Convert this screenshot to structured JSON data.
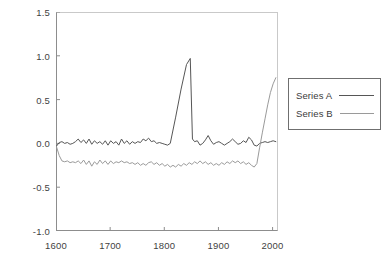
{
  "chart_data": {
    "type": "line",
    "title": "",
    "xlabel": "",
    "ylabel": "",
    "xlim": [
      1600,
      2010
    ],
    "ylim": [
      -1.0,
      1.5
    ],
    "grid": false,
    "legend_position": "right",
    "xticks": [
      1600,
      1700,
      1800,
      1900,
      2000
    ],
    "xtick_labels": [
      "1600",
      "1700",
      "1800",
      "1900",
      "2000"
    ],
    "yticks": [
      -1.0,
      -0.5,
      0.0,
      0.5,
      1.0,
      1.5
    ],
    "ytick_labels": [
      "-1.0",
      "-0.5",
      "0.0",
      "0.5",
      "1.0",
      "1.5"
    ],
    "series": [
      {
        "name": "Series A",
        "color": "#565656",
        "x": [
          1601,
          1606,
          1611,
          1616,
          1621,
          1626,
          1631,
          1636,
          1641,
          1646,
          1651,
          1656,
          1661,
          1666,
          1671,
          1676,
          1681,
          1686,
          1691,
          1696,
          1701,
          1706,
          1711,
          1716,
          1721,
          1726,
          1731,
          1736,
          1741,
          1746,
          1751,
          1756,
          1761,
          1766,
          1771,
          1776,
          1781,
          1786,
          1791,
          1796,
          1801,
          1806,
          1811,
          1821,
          1831,
          1841,
          1848,
          1852,
          1856,
          1861,
          1866,
          1871,
          1876,
          1881,
          1886,
          1891,
          1896,
          1901,
          1906,
          1911,
          1916,
          1921,
          1926,
          1931,
          1936,
          1941,
          1946,
          1951,
          1956,
          1961,
          1966,
          1971,
          1976,
          1981,
          1986,
          1991,
          1996,
          2001,
          2006
        ],
        "y": [
          -0.03,
          0.01,
          0.02,
          0.0,
          0.01,
          -0.01,
          0.0,
          0.02,
          0.05,
          0.01,
          0.04,
          0.0,
          0.05,
          -0.01,
          0.03,
          0.0,
          0.02,
          -0.01,
          0.03,
          -0.02,
          0.03,
          0.0,
          0.02,
          -0.02,
          0.05,
          0.0,
          0.03,
          -0.01,
          0.02,
          0.0,
          0.02,
          0.01,
          0.05,
          0.03,
          0.06,
          0.02,
          0.03,
          0.0,
          0.01,
          0.0,
          -0.01,
          -0.02,
          0.0,
          0.3,
          0.62,
          0.9,
          0.97,
          0.05,
          0.02,
          0.03,
          -0.02,
          0.0,
          0.04,
          0.09,
          0.03,
          -0.01,
          0.01,
          0.02,
          0.0,
          -0.02,
          0.0,
          0.02,
          0.05,
          0.02,
          -0.01,
          0.0,
          0.03,
          0.01,
          0.07,
          0.04,
          -0.02,
          -0.03,
          0.0,
          0.01,
          0.02,
          0.01,
          0.02,
          0.03,
          0.02
        ]
      },
      {
        "name": "Series B",
        "color": "#9a9a9a",
        "x": [
          1601,
          1606,
          1611,
          1616,
          1621,
          1626,
          1631,
          1636,
          1641,
          1646,
          1651,
          1656,
          1661,
          1666,
          1671,
          1676,
          1681,
          1686,
          1691,
          1696,
          1701,
          1706,
          1711,
          1716,
          1721,
          1726,
          1731,
          1736,
          1741,
          1746,
          1751,
          1756,
          1761,
          1766,
          1771,
          1776,
          1781,
          1786,
          1791,
          1796,
          1801,
          1806,
          1811,
          1816,
          1821,
          1826,
          1831,
          1836,
          1841,
          1846,
          1851,
          1856,
          1861,
          1866,
          1871,
          1876,
          1881,
          1886,
          1891,
          1896,
          1901,
          1906,
          1911,
          1916,
          1921,
          1926,
          1931,
          1936,
          1941,
          1946,
          1951,
          1956,
          1961,
          1966,
          1971,
          1976,
          1981,
          1986,
          1991,
          1996,
          2001,
          2006
        ],
        "y": [
          -0.04,
          -0.14,
          -0.2,
          -0.21,
          -0.2,
          -0.22,
          -0.21,
          -0.22,
          -0.2,
          -0.23,
          -0.19,
          -0.24,
          -0.2,
          -0.26,
          -0.21,
          -0.24,
          -0.19,
          -0.23,
          -0.2,
          -0.24,
          -0.2,
          -0.23,
          -0.21,
          -0.22,
          -0.2,
          -0.22,
          -0.21,
          -0.23,
          -0.22,
          -0.24,
          -0.22,
          -0.25,
          -0.23,
          -0.25,
          -0.22,
          -0.21,
          -0.24,
          -0.22,
          -0.25,
          -0.23,
          -0.26,
          -0.24,
          -0.27,
          -0.25,
          -0.27,
          -0.24,
          -0.26,
          -0.23,
          -0.25,
          -0.22,
          -0.24,
          -0.21,
          -0.23,
          -0.2,
          -0.23,
          -0.21,
          -0.24,
          -0.22,
          -0.25,
          -0.23,
          -0.25,
          -0.22,
          -0.24,
          -0.21,
          -0.23,
          -0.2,
          -0.22,
          -0.2,
          -0.23,
          -0.21,
          -0.24,
          -0.22,
          -0.25,
          -0.27,
          -0.23,
          -0.05,
          0.12,
          0.28,
          0.44,
          0.58,
          0.68,
          0.75
        ]
      }
    ]
  },
  "legend": {
    "entries": [
      {
        "label": "Series A"
      },
      {
        "label": "Series B"
      }
    ]
  }
}
